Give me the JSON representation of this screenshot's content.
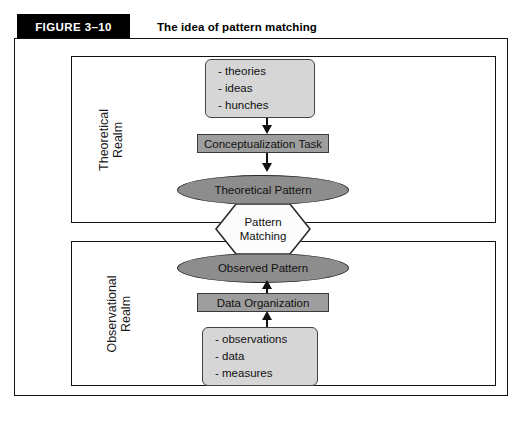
{
  "figure": {
    "tag": "FIGURE 3–10",
    "title": "The idea of pattern matching"
  },
  "realms": {
    "theoretical": "Theoretical\nRealm",
    "observational": "Observational\nRealm"
  },
  "nodes": {
    "theories_box": {
      "lines": [
        "- theories",
        "- ideas",
        "- hunches"
      ]
    },
    "conceptualization_task": "Conceptualization Task",
    "theoretical_pattern": "Theoretical Pattern",
    "pattern_matching": {
      "line1": "Pattern",
      "line2": "Matching"
    },
    "observed_pattern": "Observed Pattern",
    "data_organization": "Data Organization",
    "observations_box": {
      "lines": [
        "- observations",
        "- data",
        "- measures"
      ]
    }
  },
  "colors": {
    "header_bar": "#000000",
    "rounded_box_fill": "#d6d6d6",
    "task_rect_fill": "#9e9e9e",
    "ellipse_fill": "#8d8d8d",
    "hexagon_fill": "#fcfcfc",
    "outline": "#111111"
  },
  "flow_arrows": [
    {
      "from": "theories_box",
      "to": "conceptualization_task",
      "direction": "down"
    },
    {
      "from": "conceptualization_task",
      "to": "theoretical_pattern",
      "direction": "down"
    },
    {
      "from": "observed_pattern",
      "to": "data_organization",
      "direction": "up"
    },
    {
      "from": "data_organization",
      "to": "observations_box",
      "direction": "up"
    }
  ]
}
